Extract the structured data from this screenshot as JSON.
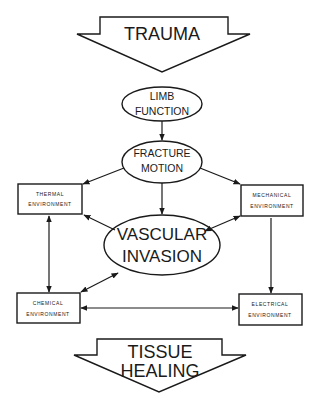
{
  "diagram": {
    "input_arrow": {
      "label": "TRAUMA"
    },
    "output_arrow": {
      "label_line1": "TISSUE",
      "label_line2": "HEALING"
    },
    "nodes": {
      "limb_function": {
        "line1": "LIMB",
        "line2": "FUNCTION",
        "shape": "ellipse"
      },
      "fracture_motion": {
        "line1": "FRACTURE",
        "line2": "MOTION",
        "shape": "ellipse"
      },
      "vascular_invasion": {
        "line1": "VASCULAR",
        "line2": "INVASION",
        "shape": "ellipse"
      },
      "thermal_environment": {
        "line1": "THERMAL",
        "line2": "ENVIRONMENT",
        "shape": "box"
      },
      "mechanical_environment": {
        "line1": "MECHANICAL",
        "line2": "ENVIRONMENT",
        "shape": "box"
      },
      "chemical_environment": {
        "line1": "CHEMICAL",
        "line2": "ENVIRONMENT",
        "shape": "box"
      },
      "electrical_environment": {
        "line1": "ELECTRICAL",
        "line2": "ENVIRONMENT",
        "shape": "box"
      }
    },
    "edges": [
      {
        "from": "TRAUMA",
        "to": "LIMB FUNCTION",
        "type": "implied-flow"
      },
      {
        "from": "LIMB FUNCTION",
        "to": "FRACTURE MOTION",
        "type": "directed"
      },
      {
        "from": "FRACTURE MOTION",
        "to": "THERMAL ENVIRONMENT",
        "type": "directed"
      },
      {
        "from": "FRACTURE MOTION",
        "to": "MECHANICAL ENVIRONMENT",
        "type": "directed"
      },
      {
        "from": "FRACTURE MOTION",
        "to": "VASCULAR INVASION",
        "type": "directed"
      },
      {
        "from": "VASCULAR INVASION",
        "to": "THERMAL ENVIRONMENT",
        "type": "directed"
      },
      {
        "from": "VASCULAR INVASION",
        "to": "MECHANICAL ENVIRONMENT",
        "type": "bidirectional"
      },
      {
        "from": "VASCULAR INVASION",
        "to": "CHEMICAL ENVIRONMENT",
        "type": "bidirectional"
      },
      {
        "from": "THERMAL ENVIRONMENT",
        "to": "CHEMICAL ENVIRONMENT",
        "type": "bidirectional"
      },
      {
        "from": "MECHANICAL ENVIRONMENT",
        "to": "ELECTRICAL ENVIRONMENT",
        "type": "directed"
      },
      {
        "from": "CHEMICAL ENVIRONMENT",
        "to": "ELECTRICAL ENVIRONMENT",
        "type": "bidirectional"
      }
    ],
    "colors": {
      "ink": "#1a1a1a",
      "background": "#ffffff"
    }
  }
}
